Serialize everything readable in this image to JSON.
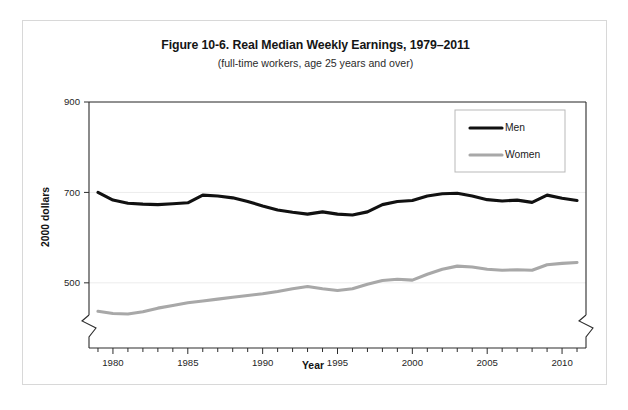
{
  "figure": {
    "title": "Figure 10-6. Real Median Weekly Earnings, 1979–2011",
    "subtitle": "(full-time workers, age 25 years and over)"
  },
  "chart_data": {
    "type": "line",
    "title": "Figure 10-6. Real Median Weekly Earnings, 1979–2011",
    "subtitle": "(full-time workers, age 25 years and over)",
    "xlabel": "Year",
    "ylabel": "2000 dollars",
    "xlim": [
      1978.4,
      2011.6
    ],
    "ylim": [
      420,
      900
    ],
    "ylim_break_below": 500,
    "grid": "horizontal-light",
    "axis_break": true,
    "legend_position": "top-right",
    "ytick_labels": [
      500,
      700,
      900
    ],
    "xtick_labels": [
      1980,
      1985,
      1990,
      1995,
      2000,
      2005,
      2010
    ],
    "xtick_minor_step": 1,
    "x": [
      1979,
      1980,
      1981,
      1982,
      1983,
      1984,
      1985,
      1986,
      1987,
      1988,
      1989,
      1990,
      1991,
      1992,
      1993,
      1994,
      1995,
      1996,
      1997,
      1998,
      1999,
      2000,
      2001,
      2002,
      2003,
      2004,
      2005,
      2006,
      2007,
      2008,
      2009,
      2010,
      2011
    ],
    "series": [
      {
        "name": "Men",
        "color": "#111111",
        "values": [
          700,
          683,
          676,
          674,
          673,
          675,
          677,
          694,
          692,
          688,
          680,
          670,
          661,
          656,
          652,
          657,
          652,
          650,
          657,
          673,
          680,
          682,
          692,
          697,
          698,
          692,
          684,
          681,
          683,
          678,
          694,
          687,
          682
        ]
      },
      {
        "name": "Women",
        "color": "#a8a8a8",
        "values": [
          437,
          432,
          431,
          436,
          444,
          450,
          456,
          460,
          464,
          468,
          472,
          476,
          481,
          487,
          492,
          487,
          483,
          487,
          497,
          505,
          508,
          506,
          519,
          530,
          537,
          535,
          530,
          528,
          529,
          528,
          540,
          543,
          545
        ]
      }
    ],
    "legend": [
      {
        "label": "Men",
        "color": "#111111"
      },
      {
        "label": "Women",
        "color": "#a8a8a8"
      }
    ]
  }
}
